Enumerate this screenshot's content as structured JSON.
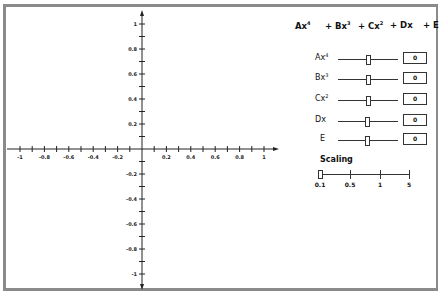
{
  "formula": {
    "terms": [
      {
        "prefix": "",
        "base": "Ax",
        "exp": "4",
        "x": 0
      },
      {
        "prefix": "+ ",
        "base": "Bx",
        "exp": "3",
        "x": 28
      },
      {
        "prefix": "+ ",
        "base": "Cx",
        "exp": "2",
        "x": 62
      },
      {
        "prefix": "+ ",
        "base": "Dx",
        "exp": "",
        "x": 93
      },
      {
        "prefix": "+ ",
        "base": "E",
        "exp": "",
        "x": 128
      }
    ],
    "t0_prefix": "",
    "t0_base": "Ax",
    "t0_exp": "4",
    "t1_prefix": "+ ",
    "t1_base": "Bx",
    "t1_exp": "3",
    "t2_prefix": "+ ",
    "t2_base": "Cx",
    "t2_exp": "2",
    "t3_prefix": "+ ",
    "t3_base": "Dx",
    "t4_prefix": "+ ",
    "t4_base": "E"
  },
  "coefficients": [
    {
      "label": "Ax",
      "exp": "4",
      "value": "0"
    },
    {
      "label": "Bx",
      "exp": "3",
      "value": "0"
    },
    {
      "label": "Cx",
      "exp": "2",
      "value": "0"
    },
    {
      "label": "Dx",
      "exp": "",
      "value": "0"
    },
    {
      "label": "E",
      "exp": "",
      "value": "0"
    }
  ],
  "scaling": {
    "label": "Scaling",
    "ticks": [
      "0.1",
      "0.5",
      "1",
      "5"
    ],
    "selected": "0.1"
  },
  "chart_data": {
    "type": "line",
    "title": "",
    "xlabel": "",
    "ylabel": "",
    "xlim": [
      -1.1,
      1.1
    ],
    "ylim": [
      -1.1,
      1.1
    ],
    "x_ticks": [
      "-1",
      "-0.8",
      "-0.6",
      "-0.4",
      "-0.2",
      "0.2",
      "0.4",
      "0.6",
      "0.8",
      "1"
    ],
    "y_ticks": [
      "1",
      "0.8",
      "0.6",
      "0.4",
      "0.2",
      "-0.2",
      "-0.4",
      "-0.6",
      "-0.8",
      "-1"
    ],
    "series": []
  }
}
